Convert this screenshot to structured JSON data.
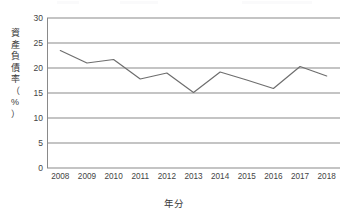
{
  "chart_data": {
    "type": "line",
    "title": "",
    "xlabel": "年分",
    "ylabel": "資產負債率（%）",
    "ylabel_chars": [
      "資",
      "產",
      "負",
      "債",
      "率",
      "（",
      "%",
      "）"
    ],
    "categories": [
      "2008",
      "2009",
      "2010",
      "2011",
      "2012",
      "2013",
      "2014",
      "2015",
      "2016",
      "2017",
      "2018"
    ],
    "values": [
      23.5,
      21.0,
      21.7,
      17.8,
      19.0,
      15.1,
      19.2,
      17.6,
      15.9,
      20.3,
      18.4
    ],
    "series": [
      {
        "name": "資產負債率（%）",
        "values": [
          23.5,
          21.0,
          21.7,
          17.8,
          19.0,
          15.1,
          19.2,
          17.6,
          15.9,
          20.3,
          18.4
        ]
      }
    ],
    "ylim": [
      0,
      30
    ],
    "ytick_values": [
      0,
      5,
      10,
      15,
      20,
      25,
      30
    ],
    "ytick_labels": [
      "0",
      "5",
      "10",
      "15",
      "20",
      "25",
      "30"
    ],
    "grid": true,
    "legend": false,
    "legend_position": "none",
    "line_color": "#6e6e6e",
    "grid_color": "#8a8a8a",
    "background_color": "#ffffff"
  }
}
